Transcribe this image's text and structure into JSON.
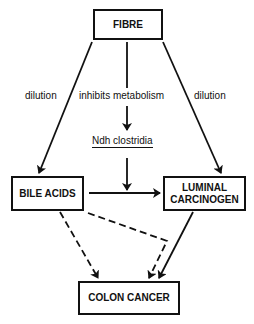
{
  "diagram": {
    "nodes": {
      "fibre": "FIBRE",
      "bile_acids": "BILE ACIDS",
      "luminal_carcinogen_line1": "LUMINAL",
      "luminal_carcinogen_line2": "CARCINOGEN",
      "colon_cancer": "COLON CANCER",
      "ndh_clostridia": "Ndh clostridia"
    },
    "edge_labels": {
      "left": "dilution",
      "center": "inhibits metabolism",
      "right": "dilution"
    },
    "edges": [
      {
        "from": "FIBRE",
        "to": "BILE ACIDS",
        "label": "dilution",
        "style": "solid"
      },
      {
        "from": "FIBRE",
        "to": "Ndh clostridia",
        "label": "inhibits metabolism",
        "style": "solid"
      },
      {
        "from": "FIBRE",
        "to": "LUMINAL CARCINOGEN",
        "label": "dilution",
        "style": "solid"
      },
      {
        "from": "Ndh clostridia",
        "to": "BILE ACIDS→LUMINAL CARCINOGEN",
        "style": "solid"
      },
      {
        "from": "BILE ACIDS",
        "to": "LUMINAL CARCINOGEN",
        "style": "solid"
      },
      {
        "from": "BILE ACIDS",
        "to": "COLON CANCER",
        "style": "dashed"
      },
      {
        "from": "BILE ACIDS",
        "to": "COLON CANCER",
        "style": "dashed",
        "via": "bend"
      },
      {
        "from": "LUMINAL CARCINOGEN",
        "to": "COLON CANCER",
        "style": "solid"
      }
    ]
  }
}
